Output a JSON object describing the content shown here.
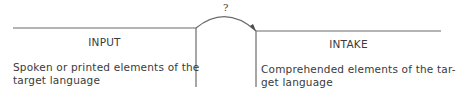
{
  "diagram": {
    "connector_label": "?",
    "left": {
      "title": "INPUT",
      "description_line1": "Spoken or printed elements of the",
      "description_line2": "target language"
    },
    "right": {
      "title": "INTAKE",
      "description_line1": "Comprehended elements of the tar-",
      "description_line2": "get language"
    },
    "line_color": "#6b6b6b",
    "text_color": "#3a3a3a"
  }
}
